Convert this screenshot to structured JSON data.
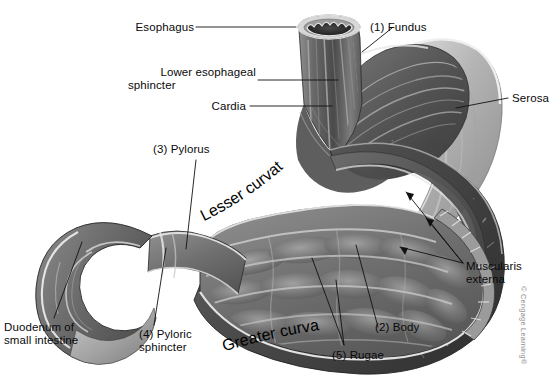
{
  "figure": {
    "kind": "labeled-anatomical-illustration",
    "style": "grayscale airbrush medical illustration",
    "background_color": "#ffffff",
    "text_color": "#0a0a0a",
    "leader_line_color": "#111111"
  },
  "labels": {
    "esophagus": "Esophagus",
    "lower_esophageal_sphincter_line1": "Lower esophageal",
    "lower_esophageal_sphincter_line2": "sphincter",
    "cardia": "Cardia",
    "pylorus": "(3) Pylorus",
    "duodenum_line1": "Duodenum of",
    "duodenum_line2": "small intestine",
    "pyloric_sphincter_line1": "(4) Pyloric",
    "pyloric_sphincter_line2": "sphincter",
    "fundus": "(1) Fundus",
    "serosa": "Serosa",
    "muscularis_line1": "Muscularis",
    "muscularis_line2": "externa",
    "body": "(2) Body",
    "rugae": "(5) Rugae",
    "lesser_curvature": "Lesser curvature",
    "greater_curvature": "Greater curvature"
  },
  "numbered_key": [
    {
      "number": "(1)",
      "term": "Fundus"
    },
    {
      "number": "(2)",
      "term": "Body"
    },
    {
      "number": "(3)",
      "term": "Pylorus"
    },
    {
      "number": "(4)",
      "term": "Pyloric sphincter"
    },
    {
      "number": "(5)",
      "term": "Rugae"
    }
  ],
  "unnumbered_terms": [
    "Esophagus",
    "Lower esophageal sphincter",
    "Cardia",
    "Duodenum of small intestine",
    "Serosa",
    "Muscularis externa",
    "Lesser curvature",
    "Greater curvature"
  ],
  "credit": "© Cengage Learning®",
  "palette": {
    "serosa_light": "#b8b8b8",
    "serosa_mid": "#9a9a9a",
    "muscle_dark": "#4a4a4a",
    "muscle_mid": "#6a6a6a",
    "mucosa_mid": "#7d7d7d",
    "mucosa_dark": "#5c5c5c",
    "rugae_highlight": "#d2d2d2",
    "outline": "#2a2a2a"
  }
}
